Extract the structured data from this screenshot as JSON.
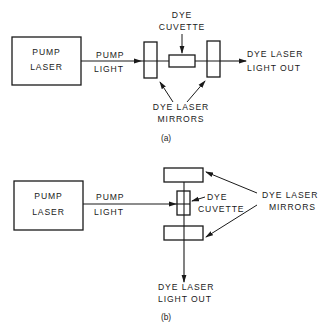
{
  "figure_a": {
    "caption": "(a)",
    "pump_laser": {
      "line1": "PUMP",
      "line2": "LASER"
    },
    "pump_light": {
      "line1": "PUMP",
      "line2": "LIGHT"
    },
    "dye_cuvette": {
      "line1": "DYE",
      "line2": "CUVETTE"
    },
    "output": {
      "line1": "DYE LASER",
      "line2": "LIGHT OUT"
    },
    "mirrors": {
      "line1": "DYE LASER",
      "line2": "MIRRORS"
    }
  },
  "figure_b": {
    "caption": "(b)",
    "pump_laser": {
      "line1": "PUMP",
      "line2": "LASER"
    },
    "pump_light": {
      "line1": "PUMP",
      "line2": "LIGHT"
    },
    "dye_cuvette": {
      "line1": "DYE",
      "line2": "CUVETTE"
    },
    "output": {
      "line1": "DYE LASER",
      "line2": "LIGHT OUT"
    },
    "mirrors": {
      "line1": "DYE LASER",
      "line2": "MIRRORS"
    }
  },
  "colors": {
    "ink": "#1a1a1a",
    "background": "#ffffff"
  }
}
